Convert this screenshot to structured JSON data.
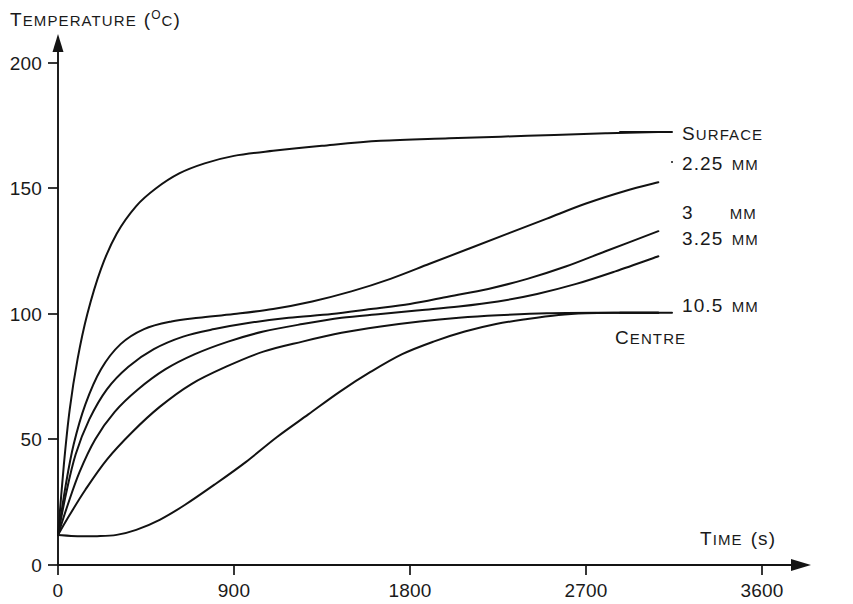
{
  "figure": {
    "background_color": "#ffffff",
    "ink_color": "#141414"
  },
  "chart_data": {
    "type": "line",
    "title": "",
    "xlabel_prefix": "T",
    "xlabel": "TIME (s)",
    "xlabel_head": "T",
    "xlabel_rest": "IME",
    "xlabel_unit": "(s)",
    "ylabel": "TEMPERATURE (°C)",
    "ylabel_head": "T",
    "ylabel_rest": "EMPERATURE",
    "ylabel_unit_open": "(",
    "ylabel_unit_deg": "O",
    "ylabel_unit_c": "C",
    "ylabel_unit_close": ")",
    "xlim": [
      0,
      3600
    ],
    "ylim": [
      0,
      200
    ],
    "xticks": [
      0,
      900,
      1800,
      2700,
      3600
    ],
    "xtick_labels": [
      "0",
      "900",
      "1800",
      "2700",
      "3600"
    ],
    "yticks": [
      0,
      50,
      100,
      150,
      200
    ],
    "ytick_labels": [
      "0",
      "50",
      "100",
      "150",
      "200"
    ],
    "grid": false,
    "legend_position": "right-inline-labels",
    "annotations": [
      {
        "text": "CENTRE",
        "x": 2530,
        "y": 88,
        "head": "C",
        "rest": "ENTRE"
      }
    ],
    "series": [
      {
        "name": "Surface",
        "label_head": "S",
        "label_rest": "URFACE",
        "label": "SURFACE",
        "label_x": 3070,
        "label_y": 163,
        "points": [
          [
            0,
            12
          ],
          [
            30,
            40
          ],
          [
            60,
            62
          ],
          [
            100,
            82
          ],
          [
            150,
            100
          ],
          [
            220,
            118
          ],
          [
            300,
            132
          ],
          [
            400,
            143
          ],
          [
            500,
            150
          ],
          [
            620,
            156
          ],
          [
            750,
            160
          ],
          [
            900,
            163
          ],
          [
            1100,
            165
          ],
          [
            1350,
            167
          ],
          [
            1650,
            169
          ],
          [
            2000,
            170
          ],
          [
            2400,
            171
          ],
          [
            2800,
            172
          ],
          [
            3070,
            172.5
          ]
        ]
      },
      {
        "name": "2.25 mm",
        "label_head": "2.25 ",
        "label_rest": "MM",
        "label": "2.25 MM",
        "label_x": 3090,
        "label_y": 152,
        "points": [
          [
            0,
            12
          ],
          [
            40,
            32
          ],
          [
            80,
            48
          ],
          [
            140,
            64
          ],
          [
            220,
            78
          ],
          [
            320,
            88
          ],
          [
            440,
            94
          ],
          [
            580,
            97
          ],
          [
            720,
            98.5
          ],
          [
            900,
            100
          ],
          [
            1100,
            102
          ],
          [
            1300,
            105
          ],
          [
            1500,
            109
          ],
          [
            1700,
            114
          ],
          [
            1900,
            120
          ],
          [
            2100,
            126
          ],
          [
            2300,
            132
          ],
          [
            2500,
            138
          ],
          [
            2700,
            144
          ],
          [
            2900,
            149
          ],
          [
            3070,
            152.5
          ]
        ]
      },
      {
        "name": "3 mm",
        "label_head": "3",
        "label_rest": "MM",
        "label": "3 MM",
        "label_x": 3090,
        "label_y": 133,
        "points": [
          [
            0,
            12
          ],
          [
            40,
            28
          ],
          [
            90,
            44
          ],
          [
            160,
            58
          ],
          [
            250,
            70
          ],
          [
            360,
            79
          ],
          [
            490,
            86
          ],
          [
            640,
            91
          ],
          [
            800,
            94
          ],
          [
            980,
            96.5
          ],
          [
            1180,
            98.5
          ],
          [
            1400,
            100
          ],
          [
            1600,
            102
          ],
          [
            1800,
            104
          ],
          [
            2000,
            107
          ],
          [
            2200,
            110
          ],
          [
            2400,
            114
          ],
          [
            2600,
            119
          ],
          [
            2800,
            125
          ],
          [
            3070,
            133
          ]
        ]
      },
      {
        "name": "3.25 mm",
        "label_head": "3.25 ",
        "label_rest": "MM",
        "label": "3.25 MM",
        "label_x": 3090,
        "label_y": 123,
        "points": [
          [
            0,
            12
          ],
          [
            50,
            24
          ],
          [
            110,
            37
          ],
          [
            190,
            50
          ],
          [
            290,
            61
          ],
          [
            410,
            70
          ],
          [
            550,
            78
          ],
          [
            700,
            84
          ],
          [
            870,
            89
          ],
          [
            1050,
            93
          ],
          [
            1250,
            96
          ],
          [
            1450,
            98.5
          ],
          [
            1650,
            100
          ],
          [
            1850,
            101.5
          ],
          [
            2050,
            103
          ],
          [
            2250,
            105
          ],
          [
            2450,
            108
          ],
          [
            2650,
            112
          ],
          [
            2850,
            117
          ],
          [
            3070,
            123
          ]
        ]
      },
      {
        "name": "10.5 mm",
        "label_head": "10.5 ",
        "label_rest": "MM",
        "label": "10.5 MM",
        "label_x": 3090,
        "label_y": 99,
        "points": [
          [
            0,
            12
          ],
          [
            60,
            20
          ],
          [
            140,
            30
          ],
          [
            250,
            42
          ],
          [
            380,
            53
          ],
          [
            520,
            63
          ],
          [
            680,
            72
          ],
          [
            860,
            79
          ],
          [
            1050,
            85
          ],
          [
            1250,
            89
          ],
          [
            1450,
            92.5
          ],
          [
            1650,
            95
          ],
          [
            1850,
            97
          ],
          [
            2050,
            98.5
          ],
          [
            2250,
            99.5
          ],
          [
            2500,
            100.3
          ],
          [
            2800,
            100.5
          ],
          [
            3070,
            100.5
          ]
        ]
      },
      {
        "name": "Centre",
        "label": "CENTRE",
        "label_x": 2530,
        "label_y": 88,
        "points": [
          [
            0,
            12
          ],
          [
            100,
            11.5
          ],
          [
            200,
            11.5
          ],
          [
            300,
            12
          ],
          [
            400,
            14
          ],
          [
            520,
            18
          ],
          [
            650,
            24
          ],
          [
            800,
            32
          ],
          [
            960,
            41
          ],
          [
            1120,
            51
          ],
          [
            1280,
            60
          ],
          [
            1440,
            69
          ],
          [
            1600,
            77
          ],
          [
            1760,
            84
          ],
          [
            1920,
            89
          ],
          [
            2080,
            93
          ],
          [
            2240,
            96
          ],
          [
            2400,
            98
          ],
          [
            2560,
            99.6
          ],
          [
            2700,
            100.3
          ],
          [
            2850,
            100.5
          ],
          [
            3070,
            100.5
          ]
        ]
      }
    ]
  }
}
